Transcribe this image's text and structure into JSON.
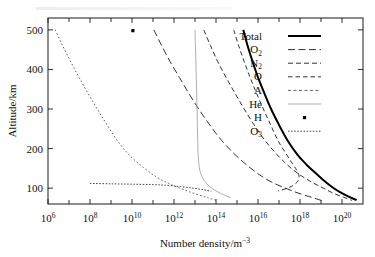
{
  "figure": {
    "background_color": "#ffffff",
    "frame_color": "#1a1a1a"
  },
  "chart_data": {
    "type": "line",
    "title": "",
    "xlabel": "Number density/m⁻³",
    "ylabel": "Altitude/km",
    "xscale": "log",
    "xlim": [
      1000000.0,
      1e+21
    ],
    "ylim": [
      60,
      530
    ],
    "grid": false,
    "legend_position": "upper right",
    "x_tick_labels": [
      "10⁶",
      "10⁸",
      "10¹⁰",
      "10¹²",
      "10¹⁴",
      "10¹⁶",
      "10¹⁸",
      "10²⁰"
    ],
    "x_tick_values": [
      1000000.0,
      100000000.0,
      10000000000.0,
      1000000000000.0,
      100000000000000.0,
      1e+16,
      1e+18,
      1e+20
    ],
    "x_minor_tick_values": [
      10000000.0,
      1000000000.0,
      100000000000.0,
      10000000000000.0,
      1000000000000000.0,
      1e+17,
      1e+19
    ],
    "y_tick_labels": [
      "100",
      "200",
      "300",
      "400",
      "500"
    ],
    "y_tick_values": [
      100,
      200,
      300,
      400,
      500
    ],
    "series": [
      {
        "name": "Total",
        "style": "solid",
        "width": 2.0,
        "color": "#000000",
        "points": [
          [
            2000000000000000.0,
            500
          ],
          [
            3200000000000000.0,
            460
          ],
          [
            5500000000000000.0,
            420
          ],
          [
            1e+16,
            380
          ],
          [
            2e+16,
            340
          ],
          [
            4.2e+16,
            300
          ],
          [
            1e+17,
            260
          ],
          [
            2.6e+17,
            220
          ],
          [
            7.5e+17,
            185
          ],
          [
            2e+18,
            160
          ],
          [
            5e+18,
            140
          ],
          [
            1.2e+19,
            122
          ],
          [
            3e+19,
            105
          ],
          [
            8e+19,
            90
          ],
          [
            2.2e+20,
            78
          ],
          [
            5e+20,
            70
          ]
        ]
      },
      {
        "name": "O₂",
        "style": "dashed-long",
        "width": 0.9,
        "color": "#1a1a1a",
        "points": [
          [
            110000000000.0,
            500
          ],
          [
            260000000000.0,
            460
          ],
          [
            650000000000.0,
            420
          ],
          [
            1800000000000.0,
            380
          ],
          [
            5000000000000.0,
            340
          ],
          [
            15000000000000.0,
            300
          ],
          [
            50000000000000.0,
            260
          ],
          [
            190000000000000.0,
            220
          ],
          [
            800000000000000.0,
            185
          ],
          [
            3500000000000000.0,
            155
          ],
          [
            1.5e+16,
            130
          ],
          [
            6e+16,
            112
          ],
          [
            2.5e+17,
            98
          ],
          [
            1e+18,
            86
          ],
          [
            4e+18,
            76
          ],
          [
            1.2e+19,
            68
          ]
        ]
      },
      {
        "name": "N₂",
        "style": "dashed-med",
        "width": 0.9,
        "color": "#1a1a1a",
        "points": [
          [
            26000000000000.0,
            500
          ],
          [
            55000000000000.0,
            460
          ],
          [
            120000000000000.0,
            420
          ],
          [
            300000000000000.0,
            380
          ],
          [
            800000000000000.0,
            340
          ],
          [
            2200000000000000.0,
            300
          ],
          [
            6500000000000000.0,
            260
          ],
          [
            2.2e+16,
            220
          ],
          [
            8e+16,
            185
          ],
          [
            3e+17,
            155
          ],
          [
            1.1e+18,
            132
          ],
          [
            4e+18,
            114
          ],
          [
            1.3e+19,
            100
          ],
          [
            4e+19,
            87
          ],
          [
            1.2e+20,
            77
          ],
          [
            3e+20,
            69
          ]
        ]
      },
      {
        "name": "O",
        "style": "dashed-short",
        "width": 0.9,
        "color": "#1a1a1a",
        "points": [
          [
            700000000000000.0,
            500
          ],
          [
            1200000000000000.0,
            460
          ],
          [
            2200000000000000.0,
            420
          ],
          [
            4200000000000000.0,
            380
          ],
          [
            8500000000000000.0,
            340
          ],
          [
            1.8e+16,
            300
          ],
          [
            4e+16,
            260
          ],
          [
            9e+16,
            220
          ],
          [
            2e+17,
            190
          ],
          [
            4e+17,
            165
          ],
          [
            7e+17,
            145
          ],
          [
            9e+17,
            130
          ],
          [
            8e+17,
            118
          ],
          [
            5e+17,
            108
          ],
          [
            2.5e+17,
            100
          ],
          [
            9e+16,
            93
          ]
        ]
      },
      {
        "name": "A",
        "style": "dotted-fine",
        "width": 0.8,
        "color": "#3a3a3a",
        "points": [
          [
            2200000.0,
            500
          ],
          [
            5000000.0,
            460
          ],
          [
            12000000.0,
            420
          ],
          [
            30000000.0,
            380
          ],
          [
            80000000.0,
            340
          ],
          [
            220000000.0,
            300
          ],
          [
            650000000.0,
            260
          ],
          [
            2000000000.0,
            220
          ],
          [
            7000000000.0,
            185
          ],
          [
            30000000000.0,
            155
          ],
          [
            130000000000.0,
            130
          ],
          [
            550000000000.0,
            112
          ],
          [
            2400000000000.0,
            98
          ],
          [
            10000000000000.0,
            86
          ],
          [
            40000000000000.0,
            76
          ],
          [
            120000000000000.0,
            68
          ]
        ]
      },
      {
        "name": "He",
        "style": "solid-light",
        "width": 0.8,
        "color": "#9a9a9a",
        "points": [
          [
            10000000000000.0,
            500
          ],
          [
            10500000000000.0,
            460
          ],
          [
            11000000000000.0,
            420
          ],
          [
            11500000000000.0,
            380
          ],
          [
            12000000000000.0,
            340
          ],
          [
            12500000000000.0,
            300
          ],
          [
            13000000000000.0,
            260
          ],
          [
            13500000000000.0,
            220
          ],
          [
            14000000000000.0,
            190
          ],
          [
            15000000000000.0,
            165
          ],
          [
            17000000000000.0,
            145
          ],
          [
            22000000000000.0,
            128
          ],
          [
            35000000000000.0,
            112
          ],
          [
            70000000000000.0,
            98
          ],
          [
            180000000000000.0,
            86
          ],
          [
            500000000000000.0,
            76
          ]
        ]
      },
      {
        "name": "H",
        "style": "marker-dot",
        "width": 0,
        "color": "#000000",
        "points": [
          [
            11000000000.0,
            498
          ]
        ]
      },
      {
        "name": "O₃",
        "style": "dotted-dense",
        "width": 0.9,
        "color": "#2a2a2a",
        "points": [
          [
            100000000.0,
            112
          ],
          [
            1000000000.0,
            111
          ],
          [
            10000000000.0,
            110
          ],
          [
            100000000000.0,
            109
          ],
          [
            500000000000.0,
            107
          ],
          [
            2000000000000.0,
            104
          ],
          [
            8000000000000.0,
            100
          ],
          [
            25000000000000.0,
            96
          ],
          [
            60000000000000.0,
            92
          ]
        ]
      }
    ],
    "legend_entries": [
      {
        "label": "Total",
        "style": "solid"
      },
      {
        "label": "O₂",
        "style": "dashed-long"
      },
      {
        "label": "N₂",
        "style": "dashed-med"
      },
      {
        "label": "O",
        "style": "dashed-short"
      },
      {
        "label": "A",
        "style": "dashed-fine"
      },
      {
        "label": "He",
        "style": "solid-light"
      },
      {
        "label": "H",
        "style": "marker-dot"
      },
      {
        "label": "O₃",
        "style": "dotted-dense"
      }
    ]
  },
  "legend": {
    "items": [
      {
        "label_base": "Total",
        "label_sub": ""
      },
      {
        "label_base": "O",
        "label_sub": "2"
      },
      {
        "label_base": "N",
        "label_sub": "2"
      },
      {
        "label_base": "O",
        "label_sub": ""
      },
      {
        "label_base": "A",
        "label_sub": ""
      },
      {
        "label_base": "He",
        "label_sub": ""
      },
      {
        "label_base": "H",
        "label_sub": ""
      },
      {
        "label_base": "O",
        "label_sub": "3"
      }
    ]
  },
  "axes": {
    "y_title": "Altitude/km",
    "x_title_base": "Number density/m",
    "x_title_sup": "−3",
    "x_labels": [
      {
        "mantissa": "10",
        "exp": "6"
      },
      {
        "mantissa": "10",
        "exp": "8"
      },
      {
        "mantissa": "10",
        "exp": "10"
      },
      {
        "mantissa": "10",
        "exp": "12"
      },
      {
        "mantissa": "10",
        "exp": "14"
      },
      {
        "mantissa": "10",
        "exp": "16"
      },
      {
        "mantissa": "10",
        "exp": "18"
      },
      {
        "mantissa": "10",
        "exp": "20"
      }
    ],
    "y_labels": [
      "500",
      "400",
      "300",
      "200",
      "100"
    ]
  }
}
